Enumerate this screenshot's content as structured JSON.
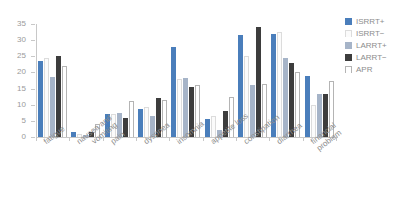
{
  "chart_data": {
    "type": "bar",
    "title": "",
    "subtitle": "",
    "xlabel": "",
    "ylabel": "",
    "ylim": [
      0,
      35
    ],
    "yticks": [
      0,
      5,
      10,
      15,
      20,
      25,
      30,
      35
    ],
    "grid": false,
    "legend_position": "right-top",
    "orientation": "vertical",
    "group_mode": "clustered",
    "categories": [
      "fatigue",
      "nausea and vomiting",
      "pain",
      "dyspnea",
      "insomnia",
      "appetite loss",
      "constipation",
      "diarrhea",
      "financial problem"
    ],
    "series": [
      {
        "name": "ISRRT+",
        "color": "#4a7ebb",
        "values": [
          23.5,
          1.5,
          7.0,
          8.6,
          28.0,
          5.5,
          31.5,
          32.0,
          19.0
        ]
      },
      {
        "name": "ISRRT−",
        "color": "#fbfbfb",
        "values": [
          24.5,
          1.0,
          7.0,
          9.4,
          18.0,
          6.5,
          25.0,
          32.5,
          10.0
        ]
      },
      {
        "name": "LARRT+",
        "color": "#a6b4c8",
        "values": [
          18.5,
          0.5,
          7.4,
          6.6,
          18.3,
          2.2,
          16.2,
          24.5,
          13.3
        ]
      },
      {
        "name": "LARRT−",
        "color": "#3d3d3d",
        "values": [
          25.0,
          1.6,
          5.8,
          12.0,
          15.4,
          8.2,
          34.0,
          23.0,
          13.3
        ]
      },
      {
        "name": "APR",
        "color": "#ffffff",
        "values": [
          22.0,
          4.0,
          11.2,
          11.6,
          16.2,
          12.5,
          16.4,
          20.0,
          17.3
        ]
      }
    ]
  },
  "legend": {
    "items": [
      {
        "label": "ISRRT+",
        "swatch": "series-0-swatch"
      },
      {
        "label": "ISRRT−",
        "swatch": "series-1-swatch"
      },
      {
        "label": "LARRT+",
        "swatch": "series-2-swatch"
      },
      {
        "label": "LARRT−",
        "swatch": "series-3-swatch"
      },
      {
        "label": "APR",
        "swatch": "series-4-swatch"
      }
    ]
  },
  "axis": {
    "y_tick_labels": [
      "0",
      "5",
      "10",
      "15",
      "20",
      "25",
      "30",
      "35"
    ],
    "x_tick_labels": [
      "fatigue",
      "nausea and\nvomiting",
      "pain",
      "dyspnea",
      "insomnia",
      "appetite loss",
      "constipation",
      "diarrhea",
      "financial\nproblem"
    ]
  }
}
